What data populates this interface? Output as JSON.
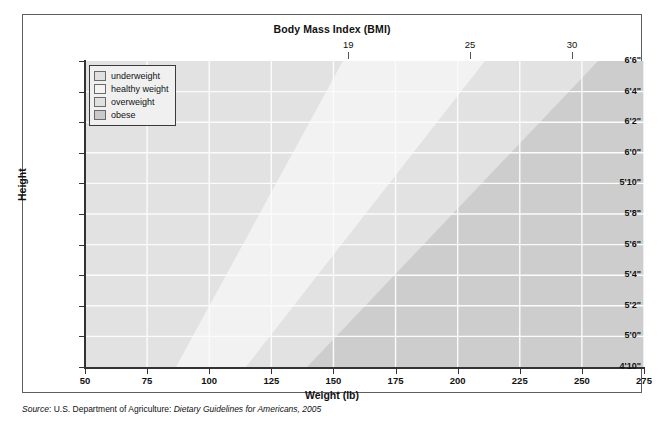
{
  "figure": {
    "title": "Body Mass Index (BMI)",
    "source_prefix": "Source",
    "source_mid": ": U.S. Department of Agriculture: ",
    "source_italic": "Dietary Guidelines for Americans, 2005"
  },
  "axes": {
    "x_title": "Weight (lb)",
    "y_title": "Height",
    "x_ticks": [
      "50",
      "75",
      "100",
      "125",
      "150",
      "175",
      "200",
      "225",
      "250",
      "275"
    ],
    "y_ticks": [
      "6'6\"",
      "6'4\"",
      "6'2\"",
      "6'0\"",
      "5'10\"",
      "5'8\"",
      "5'6\"",
      "5'4\"",
      "5'2\"",
      "5'0\"",
      "4'10\""
    ],
    "bmi_ticks": [
      "19",
      "25",
      "30"
    ]
  },
  "legend": {
    "items": [
      {
        "label": "underweight",
        "color": "#e0e0e0"
      },
      {
        "label": "healthy weight",
        "color": "#f3f3f3"
      },
      {
        "label": "overweight",
        "color": "#e0e0e0"
      },
      {
        "label": "obese",
        "color": "#c9c9c9"
      }
    ]
  },
  "chart_data": {
    "type": "area",
    "title": "Body Mass Index (BMI)",
    "xlabel": "Weight (lb)",
    "ylabel": "Height",
    "xlim": [
      50,
      275
    ],
    "ylim": [
      58,
      78
    ],
    "x_ticks": [
      50,
      75,
      100,
      125,
      150,
      175,
      200,
      225,
      250,
      275
    ],
    "y_ticks_inches": [
      78,
      76,
      74,
      72,
      70,
      68,
      66,
      64,
      62,
      60,
      58
    ],
    "y_tick_labels": [
      "6'6\"",
      "6'4\"",
      "6'2\"",
      "6'0\"",
      "5'10\"",
      "5'8\"",
      "5'6\"",
      "5'4\"",
      "5'2\"",
      "5'0\"",
      "4'10\""
    ],
    "grid": true,
    "legend_position": "top-left",
    "bmi_boundaries": [
      19,
      25,
      30
    ],
    "bmi_top_axis_labels": [
      {
        "bmi": 19,
        "weight_at_78in": 156
      },
      {
        "bmi": 25,
        "weight_at_78in": 205
      },
      {
        "bmi": 30,
        "weight_at_78in": 246
      }
    ],
    "bands": [
      {
        "name": "underweight",
        "bmi_range": [
          0,
          19
        ],
        "color": "#e0e0e0"
      },
      {
        "name": "healthy weight",
        "bmi_range": [
          19,
          25
        ],
        "color": "#f3f3f3"
      },
      {
        "name": "overweight",
        "bmi_range": [
          25,
          30
        ],
        "color": "#e0e0e0"
      },
      {
        "name": "obese",
        "bmi_range": [
          30,
          100
        ],
        "color": "#c9c9c9"
      }
    ],
    "boundary_weights_lb": {
      "bmi19": {
        "4'10\"": 91,
        "5'0\"": 97,
        "5'2\"": 104,
        "5'4\"": 111,
        "5'6\"": 118,
        "5'8\"": 125,
        "5'10\"": 132,
        "6'0\"": 140,
        "6'2\"": 148,
        "6'4\"": 156,
        "6'6\"": 164
      },
      "bmi25": {
        "4'10\"": 119,
        "5'0\"": 128,
        "5'2\"": 136,
        "5'4\"": 146,
        "5'6\"": 155,
        "5'8\"": 164,
        "5'10\"": 174,
        "6'0\"": 184,
        "6'2\"": 194,
        "6'4\"": 205,
        "6'6\"": 216
      },
      "bmi30": {
        "4'10\"": 143,
        "5'0\"": 153,
        "5'2\"": 164,
        "5'4\"": 175,
        "5'6\"": 186,
        "5'8\"": 197,
        "5'10\"": 209,
        "6'0\"": 221,
        "6'2\"": 233,
        "6'4\"": 246,
        "6'6\"": 259
      }
    }
  }
}
